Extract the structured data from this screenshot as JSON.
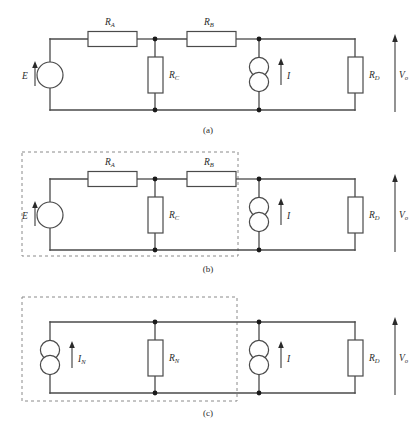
{
  "figure": {
    "background_color": "#ffffff",
    "wire_color": "#4a4a4a",
    "node_color": "#1a1a1a",
    "dashed_box_color": "#8a8a8a"
  },
  "panels": [
    {
      "id": "a",
      "caption": "(a)",
      "has_dashed_box": false,
      "components": [
        {
          "name": "voltage-source-e",
          "type": "voltage-source",
          "label": "E",
          "label_sub": ""
        },
        {
          "name": "resistor-ra",
          "type": "resistor",
          "label": "R",
          "label_sub": "A"
        },
        {
          "name": "resistor-rb",
          "type": "resistor",
          "label": "R",
          "label_sub": "B"
        },
        {
          "name": "resistor-rc",
          "type": "resistor",
          "label": "R",
          "label_sub": "C"
        },
        {
          "name": "current-source-i",
          "type": "current-source",
          "label": "I",
          "label_sub": ""
        },
        {
          "name": "resistor-rd",
          "type": "resistor",
          "label": "R",
          "label_sub": "D"
        },
        {
          "name": "output-voltage-vo",
          "type": "voltage-arrow",
          "label": "V",
          "label_sub": "o"
        }
      ]
    },
    {
      "id": "b",
      "caption": "(b)",
      "has_dashed_box": true,
      "components": [
        {
          "name": "voltage-source-e",
          "type": "voltage-source",
          "label": "E",
          "label_sub": ""
        },
        {
          "name": "resistor-ra",
          "type": "resistor",
          "label": "R",
          "label_sub": "A"
        },
        {
          "name": "resistor-rb",
          "type": "resistor",
          "label": "R",
          "label_sub": "B"
        },
        {
          "name": "resistor-rc",
          "type": "resistor",
          "label": "R",
          "label_sub": "C"
        },
        {
          "name": "current-source-i",
          "type": "current-source",
          "label": "I",
          "label_sub": ""
        },
        {
          "name": "resistor-rd",
          "type": "resistor",
          "label": "R",
          "label_sub": "D"
        },
        {
          "name": "output-voltage-vo",
          "type": "voltage-arrow",
          "label": "V",
          "label_sub": "o"
        }
      ]
    },
    {
      "id": "c",
      "caption": "(c)",
      "has_dashed_box": true,
      "components": [
        {
          "name": "current-source-in",
          "type": "current-source",
          "label": "I",
          "label_sub": "N"
        },
        {
          "name": "resistor-rn",
          "type": "resistor",
          "label": "R",
          "label_sub": "N"
        },
        {
          "name": "current-source-i",
          "type": "current-source",
          "label": "I",
          "label_sub": ""
        },
        {
          "name": "resistor-rd",
          "type": "resistor",
          "label": "R",
          "label_sub": "D"
        },
        {
          "name": "output-voltage-vo",
          "type": "voltage-arrow",
          "label": "V",
          "label_sub": "o"
        }
      ]
    }
  ],
  "labels": {
    "ra": {
      "main": "R",
      "sub": "A"
    },
    "rb": {
      "main": "R",
      "sub": "B"
    },
    "rc": {
      "main": "R",
      "sub": "C"
    },
    "rd": {
      "main": "R",
      "sub": "D"
    },
    "rn": {
      "main": "R",
      "sub": "N"
    },
    "e": {
      "main": "E",
      "sub": ""
    },
    "i": {
      "main": "I",
      "sub": ""
    },
    "in": {
      "main": "I",
      "sub": "N"
    },
    "vo": {
      "main": "V",
      "sub": "o"
    }
  },
  "captions": {
    "a": "(a)",
    "b": "(b)",
    "c": "(c)"
  }
}
